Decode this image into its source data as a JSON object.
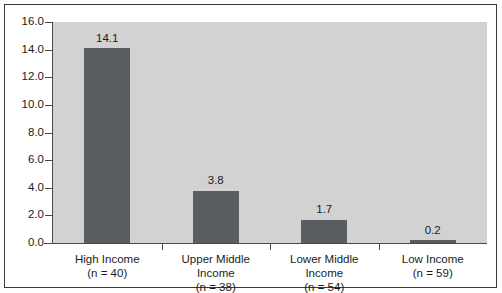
{
  "chart_data": {
    "type": "bar",
    "title": "",
    "subtitle": "",
    "xlabel": "",
    "ylabel": "",
    "categories": [
      "High Income",
      "Upper Middle Income",
      "Lower Middle Income",
      "Low Income"
    ],
    "category_sublabels": [
      "(n = 40)",
      "(n = 38)",
      "(n = 54)",
      "(n = 59)"
    ],
    "values": [
      14.1,
      3.8,
      1.7,
      0.2
    ],
    "value_labels": [
      "14.1",
      "3.8",
      "1.7",
      "0.2"
    ],
    "ylim": [
      0.0,
      16.0
    ],
    "ytick_step": 2.0,
    "ytick_labels": [
      "16.0",
      "14.0",
      "12.0",
      "10.0",
      "8.0",
      "6.0",
      "4.0",
      "2.0",
      "0.0"
    ],
    "ytick_values": [
      16.0,
      14.0,
      12.0,
      10.0,
      8.0,
      6.0,
      4.0,
      2.0,
      0.0
    ],
    "grid": false,
    "legend": false,
    "legend_position": "none",
    "colors": {
      "bar_fill": "#5a5e60",
      "plot_background": "#d2d2d2",
      "figure_background": "#ffffff",
      "axis_line": "#4a4a4a",
      "border": "#3a3a3a",
      "text": "#1c1c1c"
    }
  }
}
